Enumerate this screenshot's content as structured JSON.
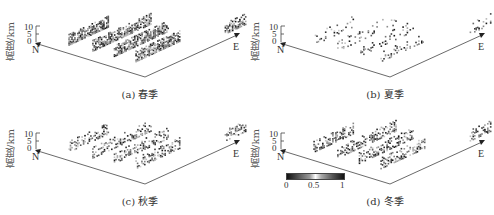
{
  "chart_data": [
    {
      "type": "heatmap",
      "title": "(a) 春季",
      "subtitle": "spring",
      "ylabel": "高度/km",
      "z_ticks": [
        "10",
        "5",
        "0"
      ],
      "axes": [
        "N",
        "E"
      ],
      "strips": 5,
      "density": "high",
      "colorbar": null
    },
    {
      "type": "heatmap",
      "title": "(b) 夏季",
      "subtitle": "summer",
      "ylabel": "高度/km",
      "z_ticks": [
        "10",
        "5",
        "0"
      ],
      "axes": [
        "N",
        "E"
      ],
      "strips": 5,
      "density": "low",
      "colorbar": null
    },
    {
      "type": "heatmap",
      "title": "(c) 秋季",
      "subtitle": "autumn",
      "ylabel": "高度/km",
      "z_ticks": [
        "10",
        "5",
        "0"
      ],
      "axes": [
        "N",
        "E"
      ],
      "strips": 5,
      "density": "medium",
      "colorbar": null
    },
    {
      "type": "heatmap",
      "title": "(d) 冬季",
      "subtitle": "winter",
      "ylabel": "高度/km",
      "z_ticks": [
        "10",
        "5",
        "0"
      ],
      "axes": [
        "N",
        "E"
      ],
      "strips": 5,
      "density": "high",
      "colorbar": {
        "min": 0,
        "max": 1,
        "ticks": [
          "0",
          "0.5",
          "1"
        ]
      }
    }
  ],
  "panels": [
    {
      "caption": "(a) 春季",
      "ylabel": "高度/km",
      "ticks": [
        "10",
        "5",
        "0"
      ],
      "n": "N",
      "e": "E"
    },
    {
      "caption": "(b) 夏季",
      "ylabel": "高度/km",
      "ticks": [
        "10",
        "5",
        "0"
      ],
      "n": "N",
      "e": "E"
    },
    {
      "caption": "(c) 秋季",
      "ylabel": "高度/km",
      "ticks": [
        "10",
        "5",
        "0"
      ],
      "n": "N",
      "e": "E"
    },
    {
      "caption": "(d) 冬季",
      "ylabel": "高度/km",
      "ticks": [
        "10",
        "5",
        "0"
      ],
      "n": "N",
      "e": "E"
    }
  ],
  "colorbar": {
    "ticks": [
      "0",
      "0.5",
      "1"
    ]
  },
  "colors": {
    "axis": "#444444",
    "dark": "#222222",
    "light": "#bbbbbb"
  }
}
